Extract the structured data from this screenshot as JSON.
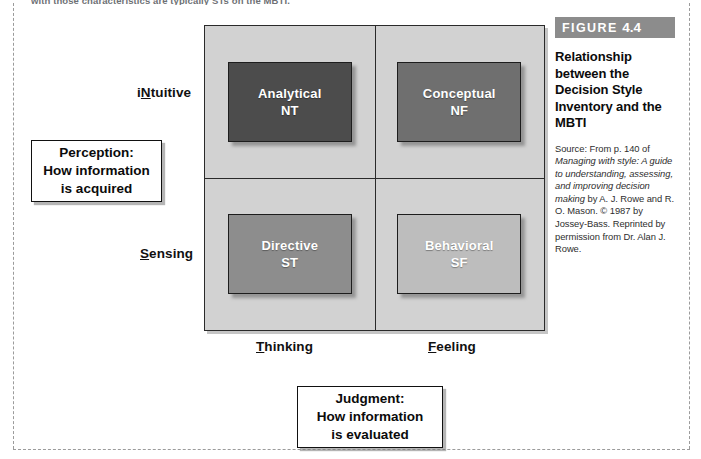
{
  "running_text": "with those characteristics are typically STs on the MBTI.",
  "figure": {
    "banner_word": "FIGURE",
    "banner_number": "4.4",
    "title": "Relationship between the Decision Style Inventory and the MBTI",
    "source_prefix": "Source: From p. 140 of ",
    "source_italic_1": "Managing with style: A guide to understanding, assessing, and improving decision making",
    "source_mid": " by A. J. Rowe and R. O. Mason. © 1987 by Jossey-Bass. Reprinted by permission from Dr. Alan J. Rowe."
  },
  "axes": {
    "y_top_prefix": "i",
    "y_top_underlined": "N",
    "y_top_suffix": "tuitive",
    "y_bottom_underlined": "S",
    "y_bottom_suffix": "ensing",
    "x_left_underlined": "T",
    "x_left_suffix": "hinking",
    "x_right_underlined": "F",
    "x_right_suffix": "eeling"
  },
  "callouts": [
    {
      "name": "perception",
      "line1": "Perception:",
      "line2": "How information",
      "line3": "is acquired"
    },
    {
      "name": "judgment",
      "line1": "Judgment:",
      "line2": "How information",
      "line3": "is evaluated"
    }
  ],
  "chart_data": {
    "type": "table",
    "title": "Relationship between the Decision Style Inventory and the MBTI",
    "xlabel": "Judgment: How information is evaluated",
    "ylabel": "Perception: How information is acquired",
    "x_categories": [
      "Thinking",
      "Feeling"
    ],
    "y_categories": [
      "iNtuitive",
      "Sensing"
    ],
    "grid": true,
    "legend": "none",
    "panel_color": "#d2d2d2",
    "cells": [
      {
        "row": "iNtuitive",
        "column": "Thinking",
        "label": "Analytical",
        "code": "NT",
        "fill": "#4c4c4c",
        "text_color": "#ffffff"
      },
      {
        "row": "iNtuitive",
        "column": "Feeling",
        "label": "Conceptual",
        "code": "NF",
        "fill": "#6f6f6f",
        "text_color": "#ffffff"
      },
      {
        "row": "Sensing",
        "column": "Thinking",
        "label": "Directive",
        "code": "ST",
        "fill": "#8d8d8d",
        "text_color": "#ffffff"
      },
      {
        "row": "Sensing",
        "column": "Feeling",
        "label": "Behavioral",
        "code": "SF",
        "fill": "#bdbdbd",
        "text_color": "#ffffff"
      }
    ]
  }
}
